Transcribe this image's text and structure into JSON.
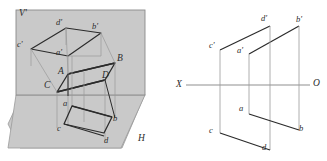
{
  "figure": {
    "colors": {
      "plane_fill": "#c9c9c9",
      "plane_stroke": "#8a8a8a",
      "object_line": "#2b2b2b",
      "thin_line": "#9a9a9a",
      "ground_line": "#8f8f8f",
      "background": "#ffffff",
      "label": "#2b2b2b"
    }
  },
  "pictorial": {
    "plane_labels": {
      "vertical_plane": "V'",
      "horizontal_plane": "H"
    },
    "front_projection_points": [
      {
        "name": "a'",
        "label": "a'",
        "x": 62,
        "y": 52
      },
      {
        "name": "b'",
        "label": "b'",
        "x": 96,
        "y": 26
      },
      {
        "name": "c'",
        "label": "c'",
        "x": 22,
        "y": 43
      },
      {
        "name": "d'",
        "label": "d'",
        "x": 60,
        "y": 22
      }
    ],
    "space_points": [
      {
        "name": "A",
        "label": "A",
        "x": 60,
        "y": 70
      },
      {
        "name": "B",
        "label": "B",
        "x": 119,
        "y": 58
      },
      {
        "name": "C",
        "label": "C",
        "x": 46,
        "y": 85
      },
      {
        "name": "D",
        "label": "D",
        "x": 104,
        "y": 75
      }
    ],
    "horizontal_projection_points": [
      {
        "name": "a",
        "label": "a",
        "x": 65,
        "y": 103
      },
      {
        "name": "b",
        "label": "b",
        "x": 115,
        "y": 118
      },
      {
        "name": "c",
        "label": "c",
        "x": 59,
        "y": 128
      },
      {
        "name": "d",
        "label": "d",
        "x": 106,
        "y": 140
      }
    ]
  },
  "orthographic": {
    "ground_line": {
      "left_label": "X",
      "right_label": "O"
    },
    "front_view_points": [
      {
        "name": "a'",
        "label": "a'",
        "x": 241,
        "y": 47
      },
      {
        "name": "b'",
        "label": "b'",
        "x": 299,
        "y": 20
      },
      {
        "name": "c'",
        "label": "c'",
        "x": 213,
        "y": 44
      },
      {
        "name": "d'",
        "label": "d'",
        "x": 263,
        "y": 19
      }
    ],
    "top_view_points": [
      {
        "name": "a",
        "label": "a",
        "x": 241,
        "y": 107
      },
      {
        "name": "b",
        "label": "b",
        "x": 298,
        "y": 123
      },
      {
        "name": "c",
        "label": "c",
        "x": 212,
        "y": 126
      },
      {
        "name": "d",
        "label": "d",
        "x": 263,
        "y": 143
      }
    ]
  }
}
